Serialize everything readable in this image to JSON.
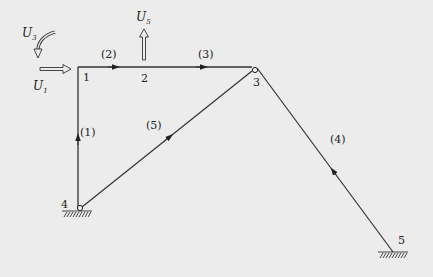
{
  "diagram": {
    "nodes": [
      {
        "id": "1",
        "label": "1",
        "x": 78,
        "y": 67
      },
      {
        "id": "2",
        "label": "2",
        "x": 148,
        "y": 67
      },
      {
        "id": "3",
        "label": "3",
        "x": 255,
        "y": 69
      },
      {
        "id": "4",
        "label": "4",
        "x": 79,
        "y": 209
      },
      {
        "id": "5",
        "label": "5",
        "x": 393,
        "y": 252
      }
    ],
    "members": [
      {
        "label": "(1)",
        "from": "4",
        "to": "1"
      },
      {
        "label": "(2)",
        "from": "1",
        "to": "2"
      },
      {
        "label": "(3)",
        "from": "2",
        "to": "3"
      },
      {
        "label": "(4)",
        "from": "5",
        "to": "3"
      },
      {
        "label": "(5)",
        "from": "4",
        "to": "3"
      }
    ],
    "dofs": [
      {
        "symbol": "U",
        "sub": "1",
        "type": "horizontal displacement"
      },
      {
        "symbol": "U",
        "sub": "3",
        "type": "rotation"
      },
      {
        "symbol": "U",
        "sub": "5",
        "type": "vertical displacement"
      }
    ],
    "supports": [
      {
        "node": "4",
        "type": "pinned"
      },
      {
        "node": "5",
        "type": "fixed"
      }
    ],
    "hinges": [
      "3",
      "4"
    ]
  }
}
